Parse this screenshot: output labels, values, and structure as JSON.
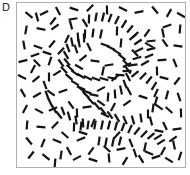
{
  "figure": {
    "panel_label": "D",
    "background_color": "#ffffff",
    "element_color": "#141414",
    "frame_border_color": "#b0b0b0",
    "frame": {
      "x": 16,
      "y": 2,
      "width": 170,
      "height": 166
    }
  },
  "chart_data": {
    "type": "scatter",
    "title": "",
    "subtitle": "",
    "xlabel": "",
    "ylabel": "",
    "grid": false,
    "legend_position": "none",
    "xlim": [
      0,
      168
    ],
    "ylim": [
      0,
      164
    ],
    "annotations": [
      "D"
    ],
    "element_length": 9,
    "element_thickness": 2.2,
    "series": [
      {
        "name": "contour-path-elements",
        "aligned": true,
        "count": 96,
        "values": [
          [
            72,
            16,
            92
          ],
          [
            79,
            14,
            100
          ],
          [
            86,
            14,
            104
          ],
          [
            93,
            15,
            110
          ],
          [
            100,
            17,
            116
          ],
          [
            107,
            21,
            122
          ],
          [
            113,
            26,
            130
          ],
          [
            118,
            32,
            138
          ],
          [
            121,
            39,
            146
          ],
          [
            122,
            47,
            154
          ],
          [
            120,
            55,
            163
          ],
          [
            116,
            62,
            172
          ],
          [
            110,
            68,
            178
          ],
          [
            103,
            72,
            184
          ],
          [
            95,
            75,
            190
          ],
          [
            87,
            76,
            196
          ],
          [
            79,
            76,
            200
          ],
          [
            71,
            75,
            205
          ],
          [
            64,
            73,
            210
          ],
          [
            58,
            70,
            215
          ],
          [
            53,
            65,
            222
          ],
          [
            50,
            59,
            230
          ],
          [
            49,
            52,
            240
          ],
          [
            51,
            45,
            250
          ],
          [
            55,
            39,
            258
          ],
          [
            61,
            34,
            266
          ],
          [
            68,
            31,
            272
          ],
          [
            76,
            30,
            277
          ],
          [
            84,
            31,
            282
          ],
          [
            64,
            86,
            40
          ],
          [
            69,
            92,
            44
          ],
          [
            74,
            98,
            48
          ],
          [
            80,
            103,
            50
          ],
          [
            86,
            108,
            52
          ],
          [
            93,
            112,
            56
          ],
          [
            100,
            115,
            60
          ],
          [
            108,
            117,
            66
          ],
          [
            116,
            117,
            74
          ],
          [
            124,
            115,
            82
          ],
          [
            131,
            111,
            90
          ],
          [
            136,
            105,
            98
          ],
          [
            139,
            98,
            106
          ],
          [
            139,
            90,
            114
          ],
          [
            137,
            83,
            122
          ],
          [
            132,
            77,
            128
          ],
          [
            126,
            73,
            134
          ],
          [
            118,
            71,
            140
          ],
          [
            57,
            124,
            92
          ],
          [
            64,
            123,
            96
          ],
          [
            71,
            122,
            98
          ],
          [
            78,
            122,
            100
          ],
          [
            85,
            122,
            102
          ],
          [
            92,
            122,
            104
          ],
          [
            99,
            123,
            106
          ],
          [
            106,
            124,
            110
          ],
          [
            113,
            126,
            114
          ],
          [
            44,
            60,
            235
          ],
          [
            47,
            67,
            228
          ],
          [
            52,
            74,
            220
          ],
          [
            58,
            80,
            212
          ],
          [
            64,
            85,
            204
          ],
          [
            70,
            89,
            198
          ],
          [
            77,
            92,
            192
          ],
          [
            88,
            42,
            20
          ],
          [
            94,
            45,
            26
          ],
          [
            100,
            49,
            32
          ],
          [
            105,
            54,
            38
          ],
          [
            109,
            60,
            46
          ],
          [
            111,
            67,
            54
          ],
          [
            111,
            74,
            62
          ],
          [
            108,
            81,
            70
          ],
          [
            104,
            87,
            78
          ],
          [
            98,
            91,
            86
          ],
          [
            91,
            94,
            94
          ],
          [
            46,
            108,
            70
          ],
          [
            52,
            113,
            74
          ],
          [
            59,
            117,
            80
          ],
          [
            66,
            120,
            86
          ],
          [
            120,
            128,
            128
          ],
          [
            127,
            131,
            134
          ],
          [
            134,
            133,
            140
          ],
          [
            141,
            134,
            148
          ],
          [
            30,
            92,
            250
          ],
          [
            33,
            99,
            244
          ],
          [
            37,
            106,
            238
          ],
          [
            42,
            112,
            232
          ],
          [
            128,
            60,
            150
          ],
          [
            132,
            53,
            158
          ],
          [
            134,
            46,
            166
          ],
          [
            134,
            38,
            174
          ],
          [
            82,
            138,
            98
          ],
          [
            89,
            139,
            100
          ],
          [
            96,
            139,
            102
          ],
          [
            103,
            138,
            104
          ],
          [
            59,
            46,
            252
          ],
          [
            62,
            40,
            260
          ],
          [
            67,
            35,
            268
          ]
        ]
      },
      {
        "name": "background-random-elements",
        "aligned": false,
        "count": 120,
        "values": [
          [
            12,
            12,
            38
          ],
          [
            27,
            10,
            155
          ],
          [
            41,
            8,
            62
          ],
          [
            57,
            6,
            18
          ],
          [
            73,
            5,
            135
          ],
          [
            90,
            7,
            88
          ],
          [
            106,
            6,
            25
          ],
          [
            122,
            9,
            168
          ],
          [
            138,
            7,
            50
          ],
          [
            152,
            10,
            120
          ],
          [
            164,
            12,
            30
          ],
          [
            9,
            27,
            100
          ],
          [
            24,
            26,
            12
          ],
          [
            38,
            24,
            143
          ],
          [
            54,
            22,
            75
          ],
          [
            150,
            23,
            160
          ],
          [
            163,
            26,
            95
          ],
          [
            7,
            42,
            80
          ],
          [
            21,
            44,
            20
          ],
          [
            35,
            41,
            130
          ],
          [
            148,
            40,
            55
          ],
          [
            161,
            43,
            8
          ],
          [
            6,
            58,
            165
          ],
          [
            20,
            60,
            45
          ],
          [
            33,
            58,
            108
          ],
          [
            145,
            57,
            175
          ],
          [
            158,
            60,
            68
          ],
          [
            5,
            74,
            25
          ],
          [
            19,
            76,
            140
          ],
          [
            32,
            74,
            90
          ],
          [
            147,
            75,
            15
          ],
          [
            160,
            78,
            128
          ],
          [
            6,
            90,
            60
          ],
          [
            20,
            92,
            150
          ],
          [
            34,
            90,
            35
          ],
          [
            150,
            92,
            105
          ],
          [
            162,
            94,
            72
          ],
          [
            8,
            106,
            118
          ],
          [
            22,
            108,
            28
          ],
          [
            36,
            106,
            158
          ],
          [
            152,
            107,
            42
          ],
          [
            164,
            110,
            88
          ],
          [
            10,
            122,
            95
          ],
          [
            24,
            124,
            5
          ],
          [
            38,
            122,
            135
          ],
          [
            148,
            123,
            65
          ],
          [
            160,
            126,
            172
          ],
          [
            12,
            138,
            50
          ],
          [
            26,
            140,
            112
          ],
          [
            40,
            138,
            22
          ],
          [
            144,
            139,
            148
          ],
          [
            157,
            142,
            78
          ],
          [
            14,
            152,
            128
          ],
          [
            29,
            154,
            38
          ],
          [
            44,
            152,
            98
          ],
          [
            60,
            155,
            152
          ],
          [
            76,
            157,
            18
          ],
          [
            92,
            155,
            85
          ],
          [
            108,
            158,
            122
          ],
          [
            124,
            156,
            58
          ],
          [
            139,
            154,
            162
          ],
          [
            152,
            157,
            32
          ],
          [
            163,
            153,
            108
          ],
          [
            50,
            36,
            115
          ],
          [
            66,
            55,
            142
          ],
          [
            78,
            58,
            8
          ],
          [
            92,
            62,
            170
          ],
          [
            104,
            40,
            95
          ],
          [
            118,
            50,
            48
          ],
          [
            130,
            30,
            125
          ],
          [
            46,
            88,
            160
          ],
          [
            62,
            64,
            30
          ],
          [
            86,
            68,
            102
          ],
          [
            98,
            75,
            140
          ],
          [
            112,
            88,
            62
          ],
          [
            126,
            94,
            18
          ],
          [
            140,
            68,
            88
          ],
          [
            70,
            104,
            172
          ],
          [
            84,
            100,
            35
          ],
          [
            96,
            104,
            118
          ],
          [
            110,
            100,
            145
          ],
          [
            134,
            118,
            75
          ],
          [
            48,
            132,
            42
          ],
          [
            64,
            136,
            158
          ],
          [
            76,
            120,
            112
          ],
          [
            88,
            112,
            25
          ],
          [
            100,
            132,
            132
          ],
          [
            114,
            140,
            68
          ],
          [
            128,
            144,
            102
          ],
          [
            142,
            128,
            12
          ],
          [
            54,
            102,
            55
          ],
          [
            40,
            70,
            148
          ],
          [
            28,
            82,
            70
          ],
          [
            16,
            66,
            118
          ],
          [
            56,
            16,
            170
          ],
          [
            68,
            20,
            58
          ],
          [
            100,
            28,
            92
          ],
          [
            116,
            34,
            142
          ],
          [
            132,
            42,
            28
          ],
          [
            146,
            30,
            78
          ],
          [
            44,
            48,
            132
          ],
          [
            30,
            50,
            18
          ],
          [
            18,
            52,
            160
          ],
          [
            72,
            44,
            65
          ],
          [
            84,
            86,
            152
          ],
          [
            60,
            110,
            88
          ],
          [
            74,
            148,
            125
          ],
          [
            90,
            146,
            42
          ],
          [
            104,
            146,
            168
          ],
          [
            118,
            150,
            72
          ],
          [
            132,
            150,
            22
          ],
          [
            146,
            148,
            118
          ],
          [
            20,
            14,
            75
          ],
          [
            36,
            18,
            128
          ],
          [
            52,
            148,
            62
          ],
          [
            38,
            160,
            95
          ],
          [
            66,
            130,
            18
          ],
          [
            110,
            62,
            155
          ],
          [
            142,
            104,
            35
          ],
          [
            156,
            136,
            145
          ]
        ]
      }
    ]
  }
}
